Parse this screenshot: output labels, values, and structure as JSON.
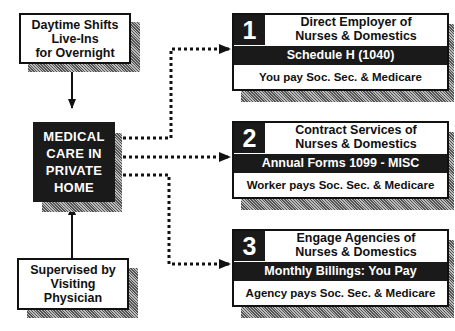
{
  "top_box": {
    "lines": [
      "Daytime Shifts",
      "Live-Ins",
      "for Overnight"
    ]
  },
  "center_box": {
    "lines": [
      "MEDICAL",
      "CARE IN",
      "PRIVATE",
      "HOME"
    ]
  },
  "bottom_box": {
    "lines": [
      "Supervised by",
      "Visiting",
      "Physician"
    ]
  },
  "options": [
    {
      "number": "1",
      "title_lines": [
        "Direct Employer of",
        "Nurses & Domestics"
      ],
      "band": "Schedule H (1040)",
      "footer": "You pay Soc. Sec. & Medicare"
    },
    {
      "number": "2",
      "title_lines": [
        "Contract Services of",
        "Nurses & Domestics"
      ],
      "band": "Annual Forms 1099 - MISC",
      "footer": "Worker pays Soc. Sec. & Medicare"
    },
    {
      "number": "3",
      "title_lines": [
        "Engage Agencies of",
        "Nurses & Domestics"
      ],
      "band": "Monthly Billings: You Pay",
      "footer": "Agency pays Soc. Sec. & Medicare"
    }
  ]
}
